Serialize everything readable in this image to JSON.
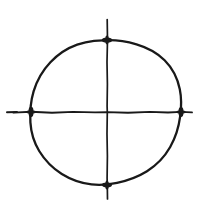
{
  "figure": {
    "title": "Hand-drawn circle bisected by vertical and horizontal axes",
    "medium": "pen-and-ink line drawing",
    "background_color": "#ffffff",
    "ink_color": "#191919",
    "canvas": {
      "width": 206,
      "height": 216
    }
  },
  "geometry": {
    "center": {
      "x": 107,
      "y": 112
    },
    "circle": {
      "radius_x": 75,
      "radius_y": 73,
      "leftmost_x": 31,
      "rightmost_x": 181,
      "topmost_y": 40,
      "bottommost_y": 185,
      "style": "freehand, slightly faceted, flattened near the top"
    },
    "horizontal_axis": {
      "start_x": 13,
      "end_x": 192,
      "y": 112
    },
    "vertical_axis": {
      "x": 107,
      "start_y": 19,
      "end_y": 199
    },
    "detached_dash": {
      "start_x": 7,
      "end_x": 17,
      "y": 112
    }
  },
  "intersection_marks": [
    {
      "name": "top-intersection",
      "x": 107,
      "y": 40
    },
    {
      "name": "right-intersection",
      "x": 181,
      "y": 112
    },
    {
      "name": "bottom-intersection",
      "x": 107,
      "y": 185
    },
    {
      "name": "left-intersection",
      "x": 31,
      "y": 112
    }
  ],
  "paths": {
    "circle_outline": "M107.5,40.2 C117,40 127,41.6 136.5,44.3 C147,47.4 157,52.6 164.6,60.2 C172.4,68 177.6,78.4 179.8,89.2 C181.6,98 181.4,107.2 180.2,116.2 C178.8,127 175.6,137.6 170.2,147 C164.6,156.8 156.6,165.2 147,171.2 C138,176.8 127.6,180.6 117,182.8 C108.6,184.6 100,185.4 91.5,184.4 C81,183.2 70.8,179.6 61.8,174 C52.6,168.2 44.8,160.2 39.2,151 C34,142.4 31,132.4 30.4,122.4 C29.8,112 30.6,101.4 33.6,91.4 C36.8,80.6 42.6,70.4 50.4,62.2 C57.8,54.4 67,48.2 77.2,44.6 C82.6,42.7 88.3,41.4 94,40.8 L107.5,40.2 Z",
    "horizontal_line": "M13.5,112.6 L31,111.8 L52,112.8 L73,111.9 L95,112.4 L107,112.1 L128,112.7 L150,111.9 L168,112.5 L181,111.9 L192,112.4",
    "vertical_line": "M107.2,19.5 L107.5,40 L107,62 L107.4,84 L107.1,106 L107.3,112 L107,134 L107.4,156 L107.1,178 L107.3,185 L107.5,199",
    "left_dash": "M7,112.3 L17,112.1"
  }
}
